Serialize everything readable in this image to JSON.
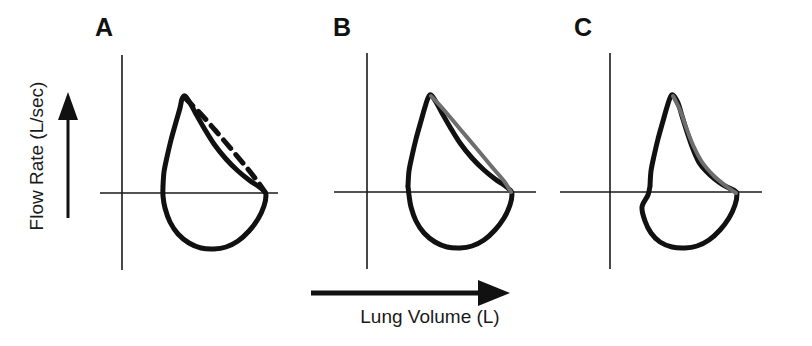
{
  "figure": {
    "background_color": "#ffffff",
    "axes": {
      "y_axis_label": "Flow Rate (L/sec)",
      "x_axis_label": "Lung Volume (L)",
      "y_arrow_direction": "up",
      "x_arrow_direction": "right",
      "axis_color": "#1a1a1a"
    },
    "panels": [
      {
        "label": "A",
        "overlay_style": "dashed",
        "overlay_color": "#111111",
        "curve_color": "#111111",
        "description": "Flow-volume loop with dashed predicted expiratory limb"
      },
      {
        "label": "B",
        "overlay_style": "solid-gray",
        "overlay_color": "#6e6e6e",
        "curve_color": "#111111",
        "description": "Flow-volume loop with gray reference expiratory limb, wide separation"
      },
      {
        "label": "C",
        "overlay_style": "solid-gray",
        "overlay_color": "#6e6e6e",
        "curve_color": "#111111",
        "description": "Flow-volume loop with gray reference expiratory limb closely overlapping measured curve"
      }
    ]
  },
  "chart_data": {
    "type": "line",
    "xlabel": "Lung Volume (L)",
    "ylabel": "Flow Rate (L/sec)",
    "grid": false,
    "legend": "none",
    "axis_arrows": {
      "x": "right",
      "y": "up"
    },
    "panels": [
      {
        "name": "A",
        "series": [
          {
            "name": "measured-loop",
            "style": "solid",
            "color": "#111111",
            "width": 5,
            "points": [
              [
                163,
                186
              ],
              [
                164,
                172
              ],
              [
                167,
                157
              ],
              [
                171,
                140
              ],
              [
                176,
                122
              ],
              [
                180,
                108
              ],
              [
                182,
                99
              ],
              [
                185,
                96
              ],
              [
                190,
                103
              ],
              [
                196,
                114
              ],
              [
                204,
                128
              ],
              [
                214,
                144
              ],
              [
                226,
                159
              ],
              [
                238,
                171
              ],
              [
                249,
                180
              ],
              [
                258,
                186
              ],
              [
                264,
                191
              ],
              [
                266,
                195
              ],
              [
                264,
                206
              ],
              [
                258,
                219
              ],
              [
                249,
                231
              ],
              [
                238,
                241
              ],
              [
                226,
                247
              ],
              [
                214,
                249
              ],
              [
                201,
                248
              ],
              [
                189,
                243
              ],
              [
                178,
                234
              ],
              [
                170,
                222
              ],
              [
                165,
                208
              ],
              [
                163,
                196
              ],
              [
                163,
                186
              ]
            ]
          },
          {
            "name": "overlay-dashed-limb",
            "style": "dashed",
            "dash_pattern": [
              11,
              8
            ],
            "color": "#111111",
            "width": 5,
            "points": [
              [
                185,
                98
              ],
              [
                199,
                112
              ],
              [
                215,
                130
              ],
              [
                232,
                150
              ],
              [
                247,
                168
              ],
              [
                258,
                182
              ],
              [
                265,
                192
              ]
            ]
          }
        ]
      },
      {
        "name": "B",
        "series": [
          {
            "name": "measured-loop",
            "style": "solid",
            "color": "#111111",
            "width": 5,
            "points": [
              [
                408,
                186
              ],
              [
                409,
                171
              ],
              [
                412,
                156
              ],
              [
                416,
                139
              ],
              [
                421,
                121
              ],
              [
                425,
                107
              ],
              [
                428,
                98
              ],
              [
                431,
                95
              ],
              [
                436,
                102
              ],
              [
                442,
                113
              ],
              [
                450,
                127
              ],
              [
                460,
                143
              ],
              [
                472,
                158
              ],
              [
                484,
                170
              ],
              [
                495,
                179
              ],
              [
                504,
                185
              ],
              [
                510,
                190
              ],
              [
                512,
                194
              ],
              [
                510,
                205
              ],
              [
                504,
                218
              ],
              [
                495,
                230
              ],
              [
                484,
                240
              ],
              [
                472,
                246
              ],
              [
                460,
                248
              ],
              [
                447,
                247
              ],
              [
                435,
                242
              ],
              [
                424,
                233
              ],
              [
                416,
                221
              ],
              [
                411,
                207
              ],
              [
                409,
                195
              ],
              [
                408,
                186
              ]
            ]
          },
          {
            "name": "overlay-gray-limb",
            "style": "solid",
            "color": "#6e6e6e",
            "width": 4,
            "points": [
              [
                431,
                96
              ],
              [
                444,
                110
              ],
              [
                460,
                129
              ],
              [
                477,
                149
              ],
              [
                492,
                167
              ],
              [
                504,
                181
              ],
              [
                511,
                192
              ]
            ]
          }
        ]
      },
      {
        "name": "C",
        "series": [
          {
            "name": "measured-loop",
            "style": "solid",
            "color": "#111111",
            "width": 5,
            "points": [
              [
                650,
                186
              ],
              [
                651,
                171
              ],
              [
                654,
                156
              ],
              [
                658,
                139
              ],
              [
                663,
                121
              ],
              [
                667,
                107
              ],
              [
                670,
                98
              ],
              [
                673,
                95
              ],
              [
                678,
                103
              ],
              [
                682,
                116
              ],
              [
                687,
                132
              ],
              [
                693,
                149
              ],
              [
                700,
                164
              ],
              [
                710,
                175
              ],
              [
                720,
                183
              ],
              [
                729,
                188
              ],
              [
                735,
                191
              ],
              [
                737,
                194
              ],
              [
                735,
                205
              ],
              [
                729,
                218
              ],
              [
                720,
                230
              ],
              [
                709,
                240
              ],
              [
                697,
                246
              ],
              [
                685,
                248
              ],
              [
                672,
                247
              ],
              [
                660,
                242
              ],
              [
                651,
                233
              ],
              [
                645,
                221
              ],
              [
                642,
                207
              ],
              [
                648,
                195
              ],
              [
                650,
                186
              ]
            ]
          },
          {
            "name": "overlay-gray-limb",
            "style": "solid",
            "color": "#6e6e6e",
            "width": 4,
            "points": [
              [
                673,
                96
              ],
              [
                680,
                110
              ],
              [
                686,
                127
              ],
              [
                693,
                145
              ],
              [
                702,
                162
              ],
              [
                714,
                176
              ],
              [
                726,
                186
              ],
              [
                736,
                193
              ]
            ]
          }
        ]
      }
    ],
    "panel_axes": [
      {
        "name": "A",
        "vertical_x": 122,
        "vertical_y0": 55,
        "vertical_y1": 270,
        "horizontal_y": 193,
        "horizontal_x0": 100,
        "horizontal_x1": 278
      },
      {
        "name": "B",
        "vertical_x": 367,
        "vertical_y0": 53,
        "vertical_y1": 269,
        "horizontal_y": 192,
        "horizontal_x0": 334,
        "horizontal_x1": 536
      },
      {
        "name": "C",
        "vertical_x": 610,
        "vertical_y0": 53,
        "vertical_y1": 269,
        "horizontal_y": 192,
        "horizontal_x0": 560,
        "horizontal_x1": 762
      }
    ]
  }
}
